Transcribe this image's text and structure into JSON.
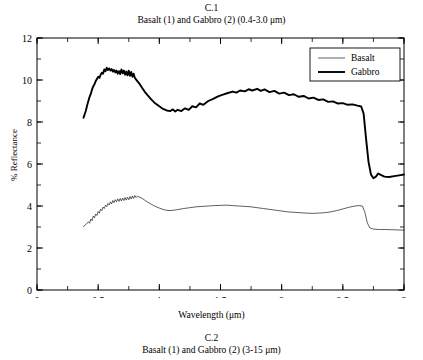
{
  "figure": {
    "number": "C.1",
    "caption": "Basalt (1) and Gabbro (2) (0.4-3.0 μm)"
  },
  "next_figure": {
    "number": "C.2",
    "caption": "Basalt (1) and Gabbro (2) (3-15 μm)"
  },
  "chart_data": {
    "type": "line",
    "title": "Basalt (1) and Gabbro (2) (0.4-3.0 μm)",
    "xlabel": "Wavelength (μm)",
    "ylabel": "% Reflectance",
    "xlim": [
      0,
      3
    ],
    "ylim": [
      0,
      12
    ],
    "xticks": [
      0,
      0.5,
      1,
      1.5,
      2,
      2.5,
      3
    ],
    "xticklabels": [
      "0",
      "0.5",
      "1",
      "1.5",
      "2",
      "2.5",
      "3"
    ],
    "xminor_step": 0.25,
    "yticks": [
      0,
      2,
      4,
      6,
      8,
      10,
      12
    ],
    "yticklabels": [
      "0",
      "2",
      "4",
      "6",
      "8",
      "10",
      "12"
    ],
    "yminor_step": 1,
    "grid": false,
    "legend_position": "top-right",
    "frame": "box",
    "tick_direction": "in",
    "series": [
      {
        "name": "Basalt",
        "color": "#1a1a1a",
        "linewidth": 0.7,
        "points": [
          [
            0.38,
            3.02
          ],
          [
            0.4,
            3.12
          ],
          [
            0.42,
            3.25
          ],
          [
            0.43,
            3.18
          ],
          [
            0.44,
            3.38
          ],
          [
            0.45,
            3.3
          ],
          [
            0.46,
            3.52
          ],
          [
            0.47,
            3.44
          ],
          [
            0.48,
            3.62
          ],
          [
            0.49,
            3.55
          ],
          [
            0.5,
            3.74
          ],
          [
            0.51,
            3.66
          ],
          [
            0.52,
            3.85
          ],
          [
            0.53,
            3.78
          ],
          [
            0.54,
            3.95
          ],
          [
            0.55,
            3.88
          ],
          [
            0.56,
            4.04
          ],
          [
            0.57,
            3.97
          ],
          [
            0.58,
            4.12
          ],
          [
            0.59,
            4.05
          ],
          [
            0.6,
            4.2
          ],
          [
            0.61,
            4.1
          ],
          [
            0.62,
            4.26
          ],
          [
            0.63,
            4.16
          ],
          [
            0.64,
            4.3
          ],
          [
            0.65,
            4.2
          ],
          [
            0.66,
            4.34
          ],
          [
            0.67,
            4.22
          ],
          [
            0.68,
            4.36
          ],
          [
            0.69,
            4.24
          ],
          [
            0.7,
            4.38
          ],
          [
            0.71,
            4.26
          ],
          [
            0.72,
            4.4
          ],
          [
            0.73,
            4.28
          ],
          [
            0.74,
            4.42
          ],
          [
            0.75,
            4.3
          ],
          [
            0.76,
            4.45
          ],
          [
            0.77,
            4.33
          ],
          [
            0.78,
            4.48
          ],
          [
            0.79,
            4.36
          ],
          [
            0.8,
            4.5
          ],
          [
            0.81,
            4.4
          ],
          [
            0.82,
            4.46
          ],
          [
            0.84,
            4.42
          ],
          [
            0.86,
            4.36
          ],
          [
            0.88,
            4.28
          ],
          [
            0.9,
            4.2
          ],
          [
            0.93,
            4.1
          ],
          [
            0.96,
            4.0
          ],
          [
            1.0,
            3.9
          ],
          [
            1.04,
            3.82
          ],
          [
            1.08,
            3.78
          ],
          [
            1.12,
            3.8
          ],
          [
            1.15,
            3.83
          ],
          [
            1.2,
            3.88
          ],
          [
            1.25,
            3.92
          ],
          [
            1.3,
            3.96
          ],
          [
            1.35,
            3.98
          ],
          [
            1.4,
            4.0
          ],
          [
            1.45,
            4.02
          ],
          [
            1.5,
            4.03
          ],
          [
            1.55,
            4.04
          ],
          [
            1.6,
            4.02
          ],
          [
            1.65,
            4.0
          ],
          [
            1.7,
            3.98
          ],
          [
            1.75,
            3.96
          ],
          [
            1.8,
            3.92
          ],
          [
            1.85,
            3.88
          ],
          [
            1.9,
            3.84
          ],
          [
            1.95,
            3.8
          ],
          [
            2.0,
            3.76
          ],
          [
            2.05,
            3.72
          ],
          [
            2.1,
            3.7
          ],
          [
            2.15,
            3.68
          ],
          [
            2.2,
            3.66
          ],
          [
            2.25,
            3.65
          ],
          [
            2.3,
            3.66
          ],
          [
            2.35,
            3.68
          ],
          [
            2.4,
            3.72
          ],
          [
            2.45,
            3.78
          ],
          [
            2.5,
            3.86
          ],
          [
            2.55,
            3.94
          ],
          [
            2.6,
            4.0
          ],
          [
            2.63,
            4.02
          ],
          [
            2.66,
            4.0
          ],
          [
            2.68,
            3.7
          ],
          [
            2.7,
            3.2
          ],
          [
            2.72,
            2.96
          ],
          [
            2.75,
            2.9
          ],
          [
            2.8,
            2.88
          ],
          [
            2.85,
            2.88
          ],
          [
            2.9,
            2.87
          ],
          [
            2.95,
            2.86
          ],
          [
            3.0,
            2.85
          ]
        ]
      },
      {
        "name": "Gabbro",
        "color": "#000000",
        "linewidth": 1.9,
        "points": [
          [
            0.38,
            8.2
          ],
          [
            0.4,
            8.55
          ],
          [
            0.41,
            8.8
          ],
          [
            0.42,
            9.0
          ],
          [
            0.43,
            9.2
          ],
          [
            0.44,
            9.35
          ],
          [
            0.45,
            9.55
          ],
          [
            0.46,
            9.7
          ],
          [
            0.47,
            9.8
          ],
          [
            0.48,
            9.95
          ],
          [
            0.49,
            10.05
          ],
          [
            0.5,
            10.15
          ],
          [
            0.51,
            10.1
          ],
          [
            0.52,
            10.25
          ],
          [
            0.53,
            10.35
          ],
          [
            0.54,
            10.3
          ],
          [
            0.55,
            10.5
          ],
          [
            0.56,
            10.42
          ],
          [
            0.57,
            10.58
          ],
          [
            0.58,
            10.48
          ],
          [
            0.59,
            10.55
          ],
          [
            0.6,
            10.45
          ],
          [
            0.61,
            10.52
          ],
          [
            0.62,
            10.4
          ],
          [
            0.63,
            10.48
          ],
          [
            0.64,
            10.36
          ],
          [
            0.65,
            10.45
          ],
          [
            0.66,
            10.3
          ],
          [
            0.67,
            10.42
          ],
          [
            0.68,
            10.28
          ],
          [
            0.69,
            10.5
          ],
          [
            0.7,
            10.32
          ],
          [
            0.71,
            10.45
          ],
          [
            0.72,
            10.25
          ],
          [
            0.73,
            10.4
          ],
          [
            0.74,
            10.22
          ],
          [
            0.75,
            10.44
          ],
          [
            0.76,
            10.2
          ],
          [
            0.77,
            10.38
          ],
          [
            0.78,
            10.15
          ],
          [
            0.79,
            10.3
          ],
          [
            0.8,
            10.1
          ],
          [
            0.82,
            9.95
          ],
          [
            0.84,
            9.8
          ],
          [
            0.86,
            9.62
          ],
          [
            0.88,
            9.45
          ],
          [
            0.9,
            9.3
          ],
          [
            0.93,
            9.1
          ],
          [
            0.96,
            8.92
          ],
          [
            1.0,
            8.75
          ],
          [
            1.03,
            8.62
          ],
          [
            1.06,
            8.55
          ],
          [
            1.09,
            8.52
          ],
          [
            1.11,
            8.6
          ],
          [
            1.13,
            8.5
          ],
          [
            1.15,
            8.58
          ],
          [
            1.18,
            8.52
          ],
          [
            1.21,
            8.65
          ],
          [
            1.24,
            8.58
          ],
          [
            1.27,
            8.75
          ],
          [
            1.3,
            8.7
          ],
          [
            1.33,
            8.88
          ],
          [
            1.36,
            8.82
          ],
          [
            1.4,
            9.0
          ],
          [
            1.44,
            9.1
          ],
          [
            1.48,
            9.22
          ],
          [
            1.52,
            9.3
          ],
          [
            1.56,
            9.38
          ],
          [
            1.6,
            9.45
          ],
          [
            1.63,
            9.4
          ],
          [
            1.66,
            9.5
          ],
          [
            1.7,
            9.46
          ],
          [
            1.73,
            9.56
          ],
          [
            1.76,
            9.5
          ],
          [
            1.8,
            9.58
          ],
          [
            1.83,
            9.48
          ],
          [
            1.86,
            9.55
          ],
          [
            1.9,
            9.42
          ],
          [
            1.94,
            9.48
          ],
          [
            1.98,
            9.35
          ],
          [
            2.02,
            9.4
          ],
          [
            2.06,
            9.28
          ],
          [
            2.1,
            9.32
          ],
          [
            2.14,
            9.2
          ],
          [
            2.18,
            9.24
          ],
          [
            2.22,
            9.12
          ],
          [
            2.26,
            9.16
          ],
          [
            2.3,
            9.05
          ],
          [
            2.34,
            9.08
          ],
          [
            2.38,
            8.96
          ],
          [
            2.42,
            8.98
          ],
          [
            2.46,
            8.88
          ],
          [
            2.5,
            8.9
          ],
          [
            2.54,
            8.82
          ],
          [
            2.58,
            8.84
          ],
          [
            2.62,
            8.78
          ],
          [
            2.65,
            8.74
          ],
          [
            2.67,
            8.4
          ],
          [
            2.69,
            7.2
          ],
          [
            2.71,
            6.1
          ],
          [
            2.73,
            5.5
          ],
          [
            2.75,
            5.32
          ],
          [
            2.77,
            5.4
          ],
          [
            2.79,
            5.55
          ],
          [
            2.81,
            5.48
          ],
          [
            2.84,
            5.4
          ],
          [
            2.88,
            5.38
          ],
          [
            2.92,
            5.42
          ],
          [
            2.96,
            5.46
          ],
          [
            3.0,
            5.5
          ]
        ]
      }
    ]
  }
}
